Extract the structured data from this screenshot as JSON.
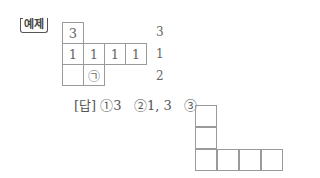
{
  "example_tag": "예제",
  "grid": {
    "cells": [
      {
        "row": 0,
        "col": 0,
        "value": "3"
      },
      {
        "row": 1,
        "col": 0,
        "value": "1"
      },
      {
        "row": 1,
        "col": 1,
        "value": "1"
      },
      {
        "row": 1,
        "col": 2,
        "value": "1"
      },
      {
        "row": 1,
        "col": 3,
        "value": "1"
      },
      {
        "row": 2,
        "col": 0,
        "value": ""
      },
      {
        "row": 2,
        "col": 1,
        "value": "㉠"
      }
    ],
    "row_labels": [
      "3",
      "1",
      "2"
    ]
  },
  "answer": {
    "label": "[답]",
    "parts": [
      "①3",
      "②1, 3",
      "③"
    ]
  },
  "answer_grid": {
    "cells": [
      {
        "row": 0,
        "col": 0
      },
      {
        "row": 1,
        "col": 0
      },
      {
        "row": 2,
        "col": 0
      },
      {
        "row": 2,
        "col": 1
      },
      {
        "row": 2,
        "col": 2
      },
      {
        "row": 2,
        "col": 3
      }
    ]
  }
}
